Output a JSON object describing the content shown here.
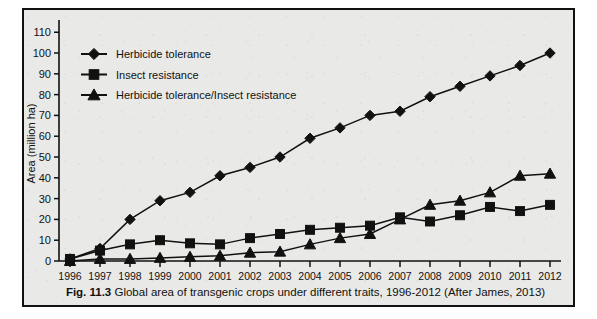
{
  "figure": {
    "caption_label": "Fig. 11.3",
    "caption_text": "Global area of transgenic crops under different traits, 1996-2012 (After James, 2013)",
    "top_cut_text": "· · ·"
  },
  "chart_data": {
    "type": "line",
    "title": "",
    "xlabel": "",
    "ylabel": "Area (million ha)",
    "x": [
      1996,
      1997,
      1998,
      1999,
      2000,
      2001,
      2002,
      2003,
      2004,
      2005,
      2006,
      2007,
      2008,
      2009,
      2010,
      2011,
      2012
    ],
    "xtick_labels": [
      "1996",
      "1997",
      "1998",
      "1999",
      "2000",
      "2001",
      "2002",
      "2003",
      "2004",
      "2005",
      "2006",
      "2007",
      "2008",
      "2009",
      "2010",
      "2011",
      "2012"
    ],
    "ytick_labels": [
      "0",
      "10",
      "20",
      "30",
      "40",
      "50",
      "60",
      "70",
      "80",
      "90",
      "100",
      "110"
    ],
    "yticks": [
      0,
      10,
      20,
      30,
      40,
      50,
      60,
      70,
      80,
      90,
      100,
      110
    ],
    "ylim": [
      0,
      113
    ],
    "xlim": [
      1995.6,
      2012.5
    ],
    "grid": false,
    "legend_position": "upper-left-inside",
    "series": [
      {
        "name": "Herbicide tolerance",
        "marker": "diamond",
        "values": [
          1,
          6,
          20,
          29,
          33,
          41,
          45,
          50,
          59,
          64,
          70,
          72,
          79,
          84,
          89,
          94,
          100
        ]
      },
      {
        "name": "Insect resistance",
        "marker": "square",
        "values": [
          1,
          5,
          8,
          10,
          8.5,
          8,
          11,
          13,
          15,
          16,
          17,
          21,
          19,
          22,
          26,
          24,
          27
        ]
      },
      {
        "name": "Herbicide tolerance/Insect resistance",
        "marker": "triangle",
        "values": [
          0,
          1,
          1,
          1.5,
          2,
          2.5,
          4,
          4.5,
          8,
          11,
          13,
          20,
          27,
          29,
          33,
          41,
          42
        ]
      }
    ]
  },
  "colors": {
    "ink": "#111111",
    "panel": "#e9e9e7",
    "page": "#ffffff"
  }
}
